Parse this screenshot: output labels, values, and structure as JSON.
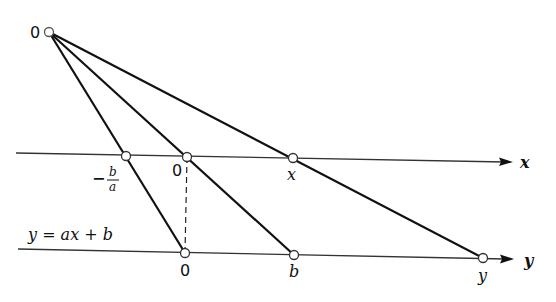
{
  "diagram": {
    "type": "nomogram",
    "colors": {
      "stroke": "#111111",
      "axis": "#333333",
      "point_fill": "#ffffff"
    },
    "origin": {
      "label": "0",
      "x": 49,
      "y": 32
    },
    "x_axis": {
      "label": "x",
      "y_start": 153,
      "y_end": 162,
      "x_start": 16,
      "x_end": 513,
      "points": [
        {
          "id": "neg-b-over-a",
          "label_sign": "−",
          "label_num": "b",
          "label_den": "a",
          "x": 126,
          "y": 156
        },
        {
          "id": "zero",
          "label": "0",
          "x": 187,
          "y": 157
        },
        {
          "id": "x",
          "label": "x",
          "x": 293,
          "y": 158
        }
      ]
    },
    "y_axis": {
      "label": "y",
      "y_start": 249,
      "y_end": 259,
      "x_start": 18,
      "x_end": 514,
      "equation": "y = ax + b",
      "points": [
        {
          "id": "zero",
          "label": "0",
          "x": 185,
          "y": 253
        },
        {
          "id": "b",
          "label": "b",
          "x": 294,
          "y": 255
        },
        {
          "id": "y",
          "label": "y",
          "x": 483,
          "y": 258
        }
      ]
    }
  }
}
